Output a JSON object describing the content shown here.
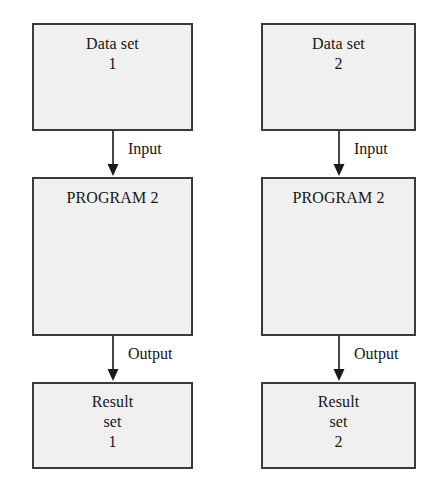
{
  "diagram": {
    "type": "flowchart",
    "orientation": "vertical",
    "columns": [
      {
        "id": "pipeline-1",
        "nodes": [
          {
            "id": "data-set-1",
            "lines": [
              "Data set",
              "1"
            ]
          },
          {
            "id": "program-1",
            "lines": [
              "PROGRAM 2"
            ]
          },
          {
            "id": "result-set-1",
            "lines": [
              "Result",
              "set",
              "1"
            ]
          }
        ],
        "edges": [
          {
            "id": "edge-input-1",
            "label": "Input",
            "from": "data-set-1",
            "to": "program-1"
          },
          {
            "id": "edge-output-1",
            "label": "Output",
            "from": "program-1",
            "to": "result-set-1"
          }
        ]
      },
      {
        "id": "pipeline-2",
        "nodes": [
          {
            "id": "data-set-2",
            "lines": [
              "Data set",
              "2"
            ]
          },
          {
            "id": "program-2",
            "lines": [
              "PROGRAM 2"
            ]
          },
          {
            "id": "result-set-2",
            "lines": [
              "Result",
              "set",
              "2"
            ]
          }
        ],
        "edges": [
          {
            "id": "edge-input-2",
            "label": "Input",
            "from": "data-set-2",
            "to": "program-2"
          },
          {
            "id": "edge-output-2",
            "label": "Output",
            "from": "program-2",
            "to": "result-set-2"
          }
        ]
      }
    ],
    "colors": {
      "node_fill": "#f0f0f0",
      "node_border": "#3a3a3a",
      "text": "#161616",
      "arrow": "#1a1a1a",
      "background": "#ffffff"
    }
  }
}
